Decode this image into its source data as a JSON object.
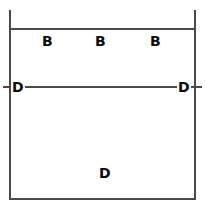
{
  "diagram": {
    "type": "dimensioned-rectangle-sketch",
    "background_color": "#ffffff",
    "line_color": "#4a4a4a",
    "text_color": "#0a0a0a",
    "top_labels": [
      {
        "text": "B"
      },
      {
        "text": "B"
      },
      {
        "text": "B"
      }
    ],
    "dimension_line": {
      "left_label": "D",
      "right_label": "D"
    },
    "area_label": {
      "text": "D"
    }
  }
}
